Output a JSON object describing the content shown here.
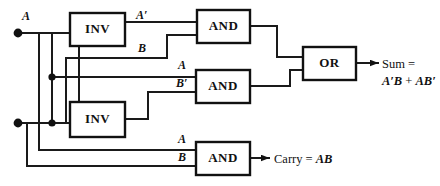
{
  "diagram": {
    "inputs": [
      {
        "name": "input-a",
        "label": "A"
      },
      {
        "name": "input-b",
        "label": "B"
      }
    ],
    "gates": [
      {
        "name": "inv-top",
        "label": "INV",
        "type": "inverter"
      },
      {
        "name": "inv-bottom",
        "label": "INV",
        "type": "inverter"
      },
      {
        "name": "and-top",
        "label": "AND",
        "type": "and"
      },
      {
        "name": "and-middle",
        "label": "AND",
        "type": "and"
      },
      {
        "name": "and-bottom",
        "label": "AND",
        "type": "and"
      },
      {
        "name": "or-gate",
        "label": "OR",
        "type": "or"
      }
    ],
    "signal_labels": {
      "a_not_top": "A′",
      "b_top": "B",
      "a_middle": "A",
      "b_not_middle": "B′",
      "a_bottom": "A",
      "b_bottom": "B"
    },
    "outputs": {
      "sum": {
        "line1": "Sum =",
        "expr_a": "A′B",
        "plus": "+",
        "expr_b": "AB′"
      },
      "carry": {
        "text": "Carry =",
        "expr": "AB"
      }
    },
    "colors": {
      "wire": "#1a1a1a",
      "box_stroke": "#111111",
      "background": "#ffffff",
      "text": "#111111"
    }
  }
}
